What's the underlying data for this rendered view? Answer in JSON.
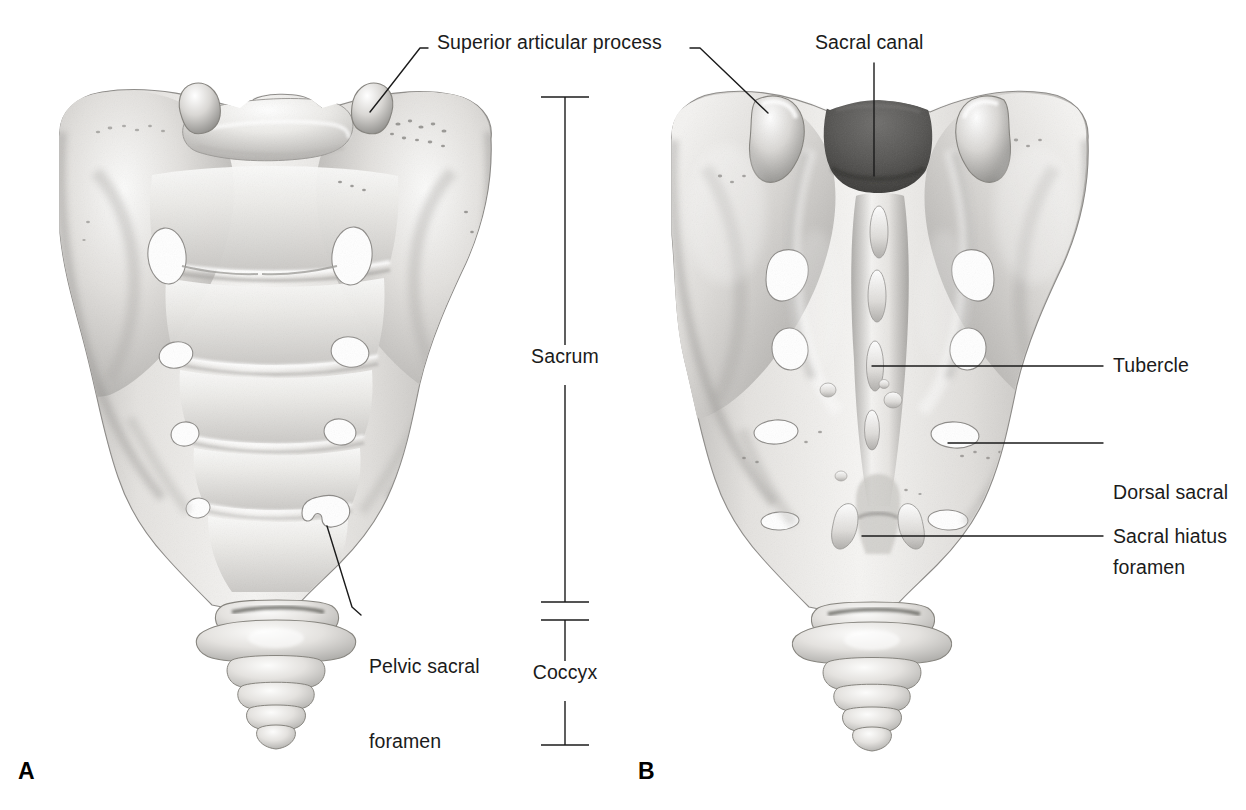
{
  "figure": {
    "background_color": "#ffffff",
    "bone_light": "#f2f1ef",
    "bone_mid": "#d8d6d3",
    "bone_dark": "#9a9a98",
    "leader_color": "#1b1b1b",
    "text_color": "#1b1b1b"
  },
  "panels": [
    {
      "letter": "A",
      "view": "anterior",
      "x": 18,
      "y": 758
    },
    {
      "letter": "B",
      "view": "posterior",
      "x": 638,
      "y": 758
    }
  ],
  "labels": [
    {
      "id": "superior-articular-process",
      "text": "Superior articular process",
      "x": 437,
      "y": 30,
      "panel": "A",
      "leaders": [
        {
          "points": "370,112 385,93 420,48 428,48"
        },
        {
          "points": "690,48 700,48 768,113"
        }
      ]
    },
    {
      "id": "sacral-canal",
      "text": "Sacral canal",
      "x": 815,
      "y": 30,
      "panel": "B",
      "leaders": [
        {
          "points": "874,63 874,176"
        }
      ]
    },
    {
      "id": "tubercle",
      "text": "Tubercle",
      "x": 1113,
      "y": 353,
      "panel": "B",
      "leaders": [
        {
          "points": "872,366 1103,366"
        }
      ]
    },
    {
      "id": "dorsal-sacral-foramen",
      "text": "Dorsal sacral\nforamen",
      "line1": "Dorsal sacral",
      "line2": "foramen",
      "x": 1113,
      "y": 430,
      "panel": "B",
      "leaders": [
        {
          "points": "948,443 1103,443"
        }
      ]
    },
    {
      "id": "sacral-hiatus",
      "text": "Sacral hiatus",
      "x": 1113,
      "y": 524,
      "panel": "B",
      "leaders": [
        {
          "points": "862,536 1103,536"
        }
      ]
    },
    {
      "id": "pelvic-sacral-foramen",
      "text": "Pelvic sacral\nforamen",
      "line1": "Pelvic sacral",
      "line2": "foramen",
      "x": 369,
      "y": 604,
      "panel": "A",
      "leaders": [
        {
          "points": "327,526 352,607 360,615"
        }
      ]
    }
  ],
  "brackets": [
    {
      "id": "sacrum",
      "label": "Sacrum",
      "label_x": 556,
      "label_y": 356,
      "axis_x": 565,
      "top_y": 97,
      "bottom_y": 602,
      "gap_top": 345,
      "gap_bottom": 385,
      "tick_half_width": 24
    },
    {
      "id": "coccyx",
      "label": "Coccyx",
      "label_x": 556,
      "label_y": 672,
      "axis_x": 565,
      "top_y": 620,
      "bottom_y": 745,
      "gap_top": 661,
      "gap_bottom": 701,
      "tick_half_width": 24
    }
  ]
}
